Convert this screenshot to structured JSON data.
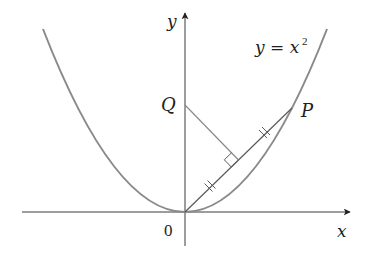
{
  "diagram": {
    "curve_label": "y = x",
    "curve_label_exponent": "2",
    "axis_labels": {
      "x": "x",
      "y": "y"
    },
    "origin_label": "0",
    "points": [
      {
        "name": "Q",
        "label": "Q",
        "description": "point on y-axis where perpendicular bisector of OP meets it"
      },
      {
        "name": "P",
        "label": "P",
        "description": "point on parabola y = x^2"
      }
    ],
    "annotations": {
      "equal_segment_ticks": "OM = MP (double tick marks)",
      "right_angle": "perpendicular from Q to OP at midpoint"
    },
    "colors": {
      "curve": "#8a8a8a",
      "axes": "#231f20",
      "segment_op": "#5a5a5a",
      "segment_q": "#8a8a8a",
      "text": "#231f20",
      "background": "#ffffff"
    }
  }
}
